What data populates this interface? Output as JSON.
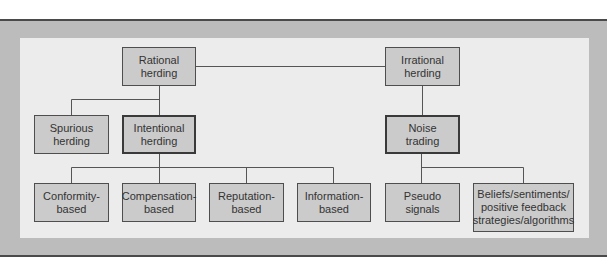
{
  "diagram": {
    "title": "",
    "nodes": {
      "rational": {
        "line1": "Rational",
        "line2": "herding"
      },
      "irrational": {
        "line1": "Irrational",
        "line2": "herding"
      },
      "spurious": {
        "line1": "Spurious",
        "line2": "herding"
      },
      "intentional": {
        "line1": "Intentional",
        "line2": "herding"
      },
      "noise": {
        "line1": "Noise",
        "line2": "trading"
      },
      "conformity": {
        "line1": "Conformity-",
        "line2": "based"
      },
      "compensation": {
        "line1": "Compensation-",
        "line2": "based"
      },
      "reputation": {
        "line1": "Reputation-",
        "line2": "based"
      },
      "information": {
        "line1": "Information-",
        "line2": "based"
      },
      "pseudo": {
        "line1": "Pseudo",
        "line2": "signals"
      },
      "beliefs": {
        "line1": "Beliefs/sentiments/",
        "line2": "positive feedback",
        "line3": "strategies/algorithms"
      }
    },
    "edges": [
      [
        "rational",
        "irrational"
      ],
      [
        "rational",
        "spurious"
      ],
      [
        "rational",
        "intentional"
      ],
      [
        "irrational",
        "noise"
      ],
      [
        "intentional",
        "conformity"
      ],
      [
        "intentional",
        "compensation"
      ],
      [
        "intentional",
        "reputation"
      ],
      [
        "intentional",
        "information"
      ],
      [
        "noise",
        "pseudo"
      ],
      [
        "noise",
        "beliefs"
      ]
    ],
    "colors": {
      "frame": "#bcbcbc",
      "panel": "#ececec",
      "node_fill": "#cbcbcb",
      "line": "#555555"
    }
  }
}
